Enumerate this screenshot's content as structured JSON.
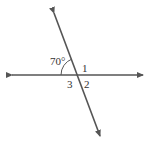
{
  "diagram": {
    "type": "intersecting-lines",
    "angle_given": "70°",
    "labels": {
      "angle1": "1",
      "angle2": "2",
      "angle3": "3"
    },
    "colors": {
      "line": "#555555",
      "text": "#333333",
      "background": "#ffffff"
    }
  }
}
